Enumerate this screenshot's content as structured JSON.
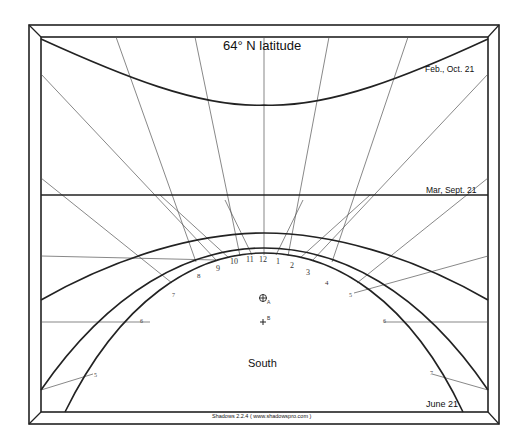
{
  "title": "64° N latitude",
  "date_labels": {
    "feb_oct": "Feb., Oct. 21",
    "mar_sept": "Mar, Sept. 21",
    "june": "June 21"
  },
  "direction_label": "South",
  "markers": {
    "a_label": "A",
    "b_label": "B"
  },
  "footer": "Shadows 2.2.4 ( www.shadowspro.com )",
  "hour_labels": [
    "5",
    "6",
    "7",
    "8",
    "9",
    "10",
    "11",
    "12",
    "1",
    "2",
    "3",
    "4",
    "5",
    "6",
    "7"
  ],
  "colors": {
    "line": "#222222",
    "thin_line": "#555555",
    "background": "#ffffff"
  }
}
